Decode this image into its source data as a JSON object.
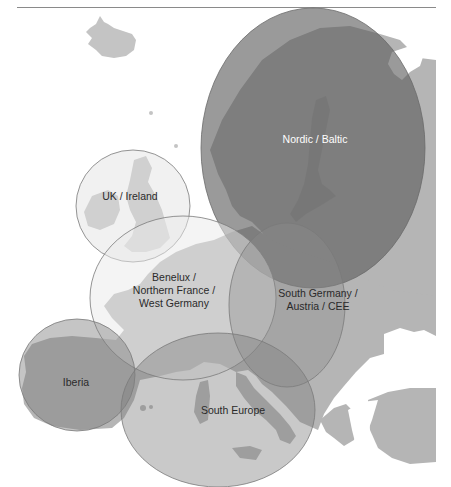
{
  "map": {
    "type": "region-map",
    "subject": "Europe",
    "colors": {
      "background": "#ffffff",
      "land": "#b5b5b5",
      "land_light": "#c4c4c4",
      "rule": "#8a8a8a",
      "circle_stroke": "#7a7a7a"
    },
    "regions": [
      {
        "id": "nordic-baltic",
        "label_lines": [
          "Nordic / Baltic"
        ],
        "cx": 313,
        "cy": 148,
        "rx": 112,
        "ry": 140,
        "fill": "#5c5c5c",
        "opacity": 0.62,
        "label_x": 315,
        "label_y": 143,
        "label_color": "#ffffff"
      },
      {
        "id": "uk-ireland",
        "label_lines": [
          "UK / Ireland"
        ],
        "cx": 133,
        "cy": 206,
        "rx": 57,
        "ry": 56,
        "fill": "#e6e6e6",
        "opacity": 0.55,
        "label_x": 130,
        "label_y": 200,
        "label_color": "#2a2a2a"
      },
      {
        "id": "benelux-france-germany",
        "label_lines": [
          "Benelux /",
          "Northern France /",
          "West Germany"
        ],
        "cx": 183,
        "cy": 298,
        "rx": 93,
        "ry": 82,
        "fill": "#e9e9e9",
        "opacity": 0.5,
        "label_x": 174,
        "label_y": 281,
        "label_color": "#2a2a2a"
      },
      {
        "id": "south-germany-austria-cee",
        "label_lines": [
          "South Germany /",
          "Austria / CEE"
        ],
        "cx": 287,
        "cy": 305,
        "rx": 58,
        "ry": 82,
        "fill": "#8c8c8c",
        "opacity": 0.38,
        "label_x": 318,
        "label_y": 297,
        "label_color": "#2a2a2a"
      },
      {
        "id": "iberia",
        "label_lines": [
          "Iberia"
        ],
        "cx": 77,
        "cy": 375,
        "rx": 58,
        "ry": 56,
        "fill": "#7f7f7f",
        "opacity": 0.45,
        "label_x": 76,
        "label_y": 386,
        "label_color": "#2a2a2a"
      },
      {
        "id": "south-europe",
        "label_lines": [
          "South Europe"
        ],
        "cx": 218,
        "cy": 410,
        "rx": 97,
        "ry": 77,
        "fill": "#7f7f7f",
        "opacity": 0.42,
        "label_x": 233,
        "label_y": 414,
        "label_color": "#2a2a2a"
      }
    ]
  },
  "labels": {
    "nordic_baltic": "Nordic / Baltic",
    "uk_ireland": "UK / Ireland",
    "benelux_1": "Benelux /",
    "benelux_2": "Northern France /",
    "benelux_3": "West Germany",
    "sgermany_1": "South Germany /",
    "sgermany_2": "Austria / CEE",
    "iberia": "Iberia",
    "south_europe": "South Europe"
  }
}
